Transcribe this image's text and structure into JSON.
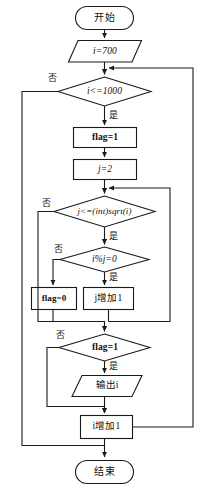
{
  "diagram": {
    "language": "zh-CN",
    "stroke_color": "#1a1a1a",
    "fill_color": "#ffffff",
    "text_color": "#101010"
  },
  "nodes": {
    "start": {
      "label": "开始",
      "shape": "terminal"
    },
    "init_i": {
      "label": "i=700",
      "shape": "parallelogram"
    },
    "cond_i": {
      "label": "i<=1000",
      "shape": "diamond"
    },
    "set_flag1": {
      "label": "flag=1",
      "shape": "rect"
    },
    "set_j2": {
      "label": "j=2",
      "shape": "rect"
    },
    "cond_j": {
      "label": "j<=(int)sqrt(i)",
      "shape": "diamond"
    },
    "cond_mod": {
      "label": "i%j=0",
      "shape": "diamond"
    },
    "set_flag0": {
      "label": "flag=0",
      "shape": "rect"
    },
    "inc_j": {
      "label": "j增加1",
      "shape": "rect"
    },
    "cond_flag": {
      "label": "flag=1",
      "shape": "diamond"
    },
    "output_i": {
      "label": "输出i",
      "shape": "parallelogram"
    },
    "inc_i": {
      "label": "i增加1",
      "shape": "rect"
    },
    "end": {
      "label": "结束",
      "shape": "terminal"
    }
  },
  "branch_labels": {
    "cond_i_no": "否",
    "cond_i_yes": "是",
    "cond_j_no": "否",
    "cond_j_yes": "是",
    "cond_mod_no": "否",
    "cond_mod_yes": "是",
    "cond_flag_no": "否",
    "cond_flag_yes": "是"
  }
}
